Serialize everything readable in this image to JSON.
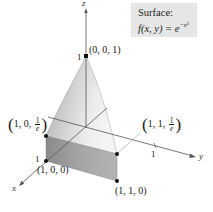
{
  "caption": {
    "title": "Surface:",
    "formula_prefix": "f(x, y) = e",
    "formula_exponent": "−x²"
  },
  "axes": {
    "x_label": "x",
    "y_label": "y",
    "z_label": "z",
    "z_tick": "1",
    "x_tick": "1",
    "y_tick": "1"
  },
  "points": [
    {
      "id": "apex",
      "label": "(0, 0, 1)"
    },
    {
      "id": "x1-top",
      "label_prefix": "1, 0, ",
      "frac_num": "1",
      "frac_den": "e"
    },
    {
      "id": "x1-base",
      "label": "(1, 0, 0)"
    },
    {
      "id": "xy1-top",
      "label_prefix": "1, 1, ",
      "frac_num": "1",
      "frac_den": "e"
    },
    {
      "id": "xy1-base",
      "label": "(1, 1, 0)"
    }
  ],
  "colors": {
    "surface_light": "#f0f0f0",
    "surface_mid": "#c8c8c8",
    "surface_dark": "#9a9a9a",
    "front_face": "#a8a8a8",
    "front_face_dark": "#8c8c8c",
    "axis": "#555555",
    "caption_bg": "#e6e6e6"
  }
}
